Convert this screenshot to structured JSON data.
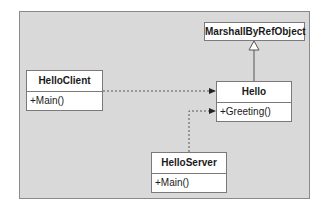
{
  "diagram": {
    "type": "uml-class-diagram",
    "classes": [
      {
        "id": "marshall",
        "name": "MarshallByRefObject",
        "operations": []
      },
      {
        "id": "hello-client",
        "name": "HelloClient",
        "operations": [
          "+Main()"
        ]
      },
      {
        "id": "hello",
        "name": "Hello",
        "operations": [
          "+Greeting()"
        ]
      },
      {
        "id": "hello-server",
        "name": "HelloServer",
        "operations": [
          "+Main()"
        ]
      }
    ],
    "relationships": [
      {
        "from": "Hello",
        "to": "MarshallByRefObject",
        "kind": "generalization"
      },
      {
        "from": "HelloClient",
        "to": "Hello",
        "kind": "dependency"
      },
      {
        "from": "HelloServer",
        "to": "Hello",
        "kind": "dependency"
      }
    ]
  },
  "colors": {
    "panel": "#d9d9d9",
    "box": "#ffffff",
    "border": "#7a7a7a",
    "line": "#555555"
  }
}
